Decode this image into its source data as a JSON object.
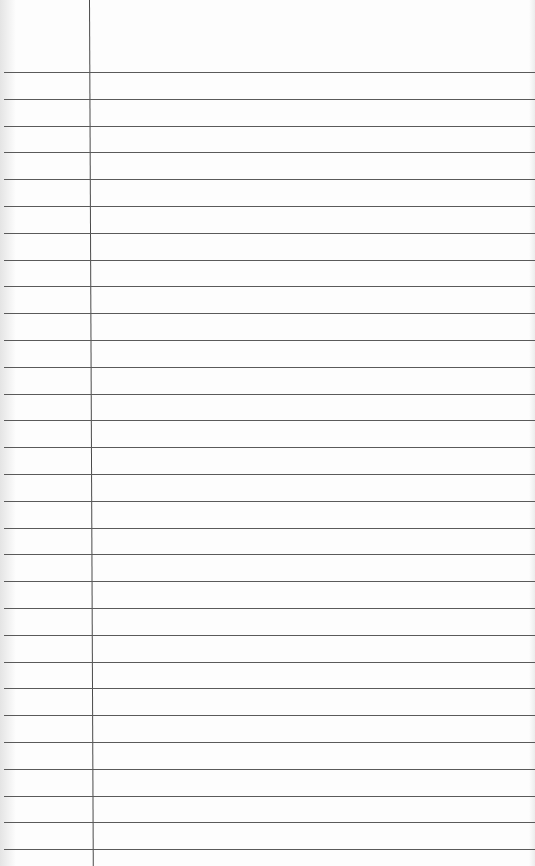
{
  "paper": {
    "type": "lined-paper",
    "line_count": 30,
    "first_line_y": 72,
    "line_spacing": 26.8,
    "margin_x": 89,
    "line_color": "#5a5a5a",
    "margin_color": "#4a4a4a",
    "background": "#fdfdfd"
  }
}
